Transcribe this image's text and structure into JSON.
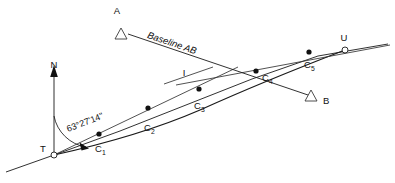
{
  "figure": {
    "type": "survey-alignment-diagram",
    "background_color": "#ffffff",
    "ink_color": "#1a1a1a"
  },
  "labels": {
    "north": "N",
    "station_t": "T",
    "station_u": "U",
    "control_a": "A",
    "control_b": "B",
    "intersection": "I",
    "baseline": "Baseline AB",
    "bearing": "63°27'14\""
  },
  "curve_points": [
    {
      "id": "c1",
      "letter": "C",
      "index": "1",
      "label": "C₁",
      "x": 99,
      "y": 141
    },
    {
      "id": "c2",
      "letter": "C",
      "index": "2",
      "label": "C₂",
      "x": 148,
      "y": 123
    },
    {
      "id": "c3",
      "letter": "C",
      "index": "3",
      "label": "C₃",
      "x": 198,
      "y": 99
    },
    {
      "id": "c4",
      "letter": "C",
      "index": "4",
      "label": "C₄",
      "x": 256,
      "y": 76
    },
    {
      "id": "c5",
      "letter": "C",
      "index": "5",
      "label": "C₅",
      "x": 308,
      "y": 57
    }
  ],
  "terminal_points": [
    {
      "id": "t",
      "label": "T",
      "x": 54,
      "y": 155,
      "marker": "open-circle"
    },
    {
      "id": "u",
      "label": "U",
      "x": 345,
      "y": 50,
      "marker": "open-circle"
    }
  ],
  "triangles": [
    {
      "id": "a",
      "label": "A",
      "x": 121,
      "y": 24
    },
    {
      "id": "b",
      "label": "B",
      "x": 310,
      "y": 100
    }
  ],
  "north_arrow": {
    "label": "N",
    "base_x": 54,
    "base_y": 155,
    "tip_x": 54,
    "tip_y": 74
  },
  "angle": {
    "value": "63°27'14\"",
    "vertex_x": 54,
    "vertex_y": 155,
    "from": "N",
    "to": "T-C1 tangent"
  }
}
